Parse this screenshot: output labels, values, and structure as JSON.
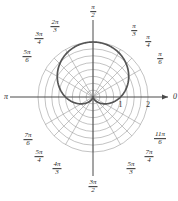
{
  "figure": {
    "kind": "polar-plot",
    "background_color": "#ffffff",
    "curve_color": "#555555",
    "grid_color": "#9a9a9a",
    "axis_color": "#4a4a4a",
    "text_color": "#2b2b2b"
  },
  "axes": {
    "origin_x": 93,
    "origin_y": 97,
    "unit_px": 27.5,
    "r_ticks": [
      {
        "label": "1",
        "value": 1
      },
      {
        "label": "2",
        "value": 2
      }
    ],
    "grid_circle_count": 8,
    "grid_circle_step": 0.25,
    "angle_spokes_deg": [
      0,
      30,
      45,
      60,
      90,
      120,
      135,
      150,
      180,
      210,
      225,
      240,
      270,
      300,
      315,
      330
    ],
    "left_axis_label": "π",
    "right_axis_label": "0",
    "right_axis_has_arrow": true
  },
  "angle_labels": [
    {
      "name": "pi-over-2",
      "num": "π",
      "den": "2",
      "deg": 90,
      "x": 93,
      "y": 12
    },
    {
      "name": "pi-over-3",
      "num": "π",
      "den": "3",
      "deg": 60,
      "x": 134,
      "y": 31
    },
    {
      "name": "pi-over-4",
      "num": "π",
      "den": "4",
      "deg": 45,
      "x": 148,
      "y": 42
    },
    {
      "name": "pi-over-6",
      "num": "π",
      "den": "6",
      "deg": 30,
      "x": 160,
      "y": 59
    },
    {
      "name": "two-pi-over-3",
      "num": "2π",
      "den": "3",
      "deg": 120,
      "x": 55,
      "y": 27
    },
    {
      "name": "three-pi-over-4",
      "num": "3π",
      "den": "4",
      "deg": 135,
      "x": 39,
      "y": 39
    },
    {
      "name": "five-pi-over-6",
      "num": "5π",
      "den": "6",
      "deg": 150,
      "x": 27,
      "y": 57
    },
    {
      "name": "seven-pi-over-6",
      "num": "7π",
      "den": "6",
      "deg": 210,
      "x": 28,
      "y": 140
    },
    {
      "name": "five-pi-over-4",
      "num": "5π",
      "den": "4",
      "deg": 225,
      "x": 39,
      "y": 157
    },
    {
      "name": "four-pi-over-3",
      "num": "4π",
      "den": "3",
      "deg": 240,
      "x": 57,
      "y": 169
    },
    {
      "name": "three-pi-over-2",
      "num": "3π",
      "den": "2",
      "deg": 270,
      "x": 93,
      "y": 187
    },
    {
      "name": "five-pi-over-3",
      "num": "5π",
      "den": "3",
      "deg": 300,
      "x": 131,
      "y": 169
    },
    {
      "name": "seven-pi-over-4",
      "num": "7π",
      "den": "4",
      "deg": 315,
      "x": 149,
      "y": 157
    },
    {
      "name": "eleven-pi-over-6",
      "num": "11π",
      "den": "6",
      "deg": 330,
      "x": 160,
      "y": 139
    }
  ],
  "chart_data": {
    "type": "line",
    "coordinate_system": "polar",
    "title": "",
    "xlabel": "",
    "ylabel": "",
    "grid": true,
    "legend": null,
    "rlim": [
      0,
      2
    ],
    "theta_unit": "radians",
    "series": [
      {
        "name": "cardioid",
        "equation": "r = 1 + sin(theta)",
        "color": "#555555",
        "points_theta_deg": [
          0,
          15,
          30,
          45,
          60,
          75,
          90,
          105,
          120,
          135,
          150,
          165,
          180,
          195,
          210,
          225,
          240,
          255,
          270,
          285,
          300,
          315,
          330,
          345,
          360
        ],
        "points_r": [
          1.0,
          1.259,
          1.5,
          1.707,
          1.866,
          1.966,
          2.0,
          1.966,
          1.866,
          1.707,
          1.5,
          1.259,
          1.0,
          0.741,
          0.5,
          0.293,
          0.134,
          0.034,
          0.0,
          0.034,
          0.134,
          0.293,
          0.5,
          0.741,
          1.0
        ]
      }
    ],
    "annotations": [
      {
        "text": "1",
        "kind": "r-tick",
        "r": 1
      },
      {
        "text": "2",
        "kind": "r-tick",
        "r": 2
      },
      {
        "text": "π",
        "kind": "angle-axis-left"
      },
      {
        "text": "0",
        "kind": "angle-axis-right"
      }
    ]
  }
}
